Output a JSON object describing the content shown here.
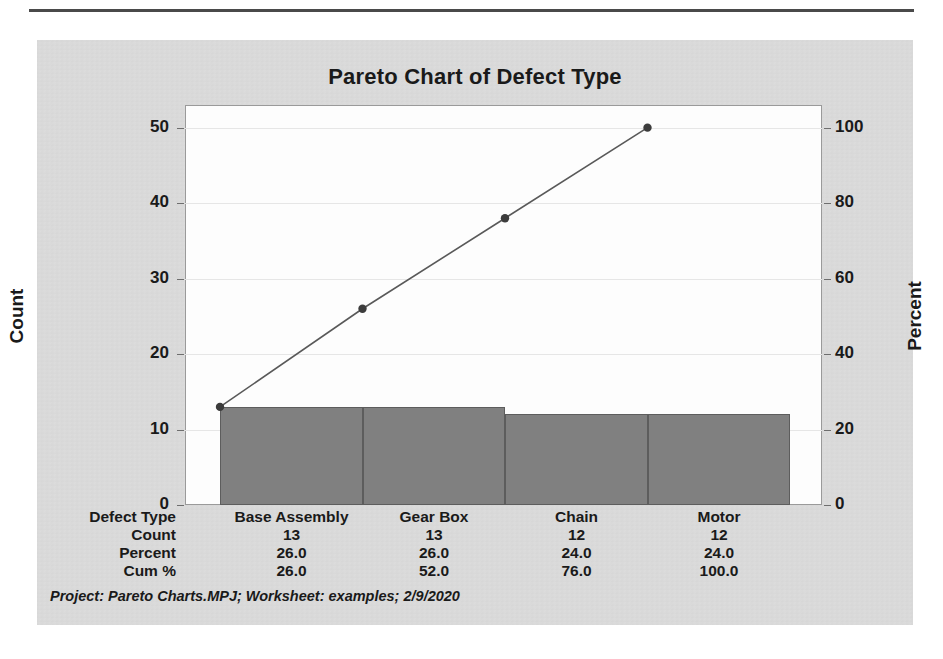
{
  "chart_data": {
    "type": "bar",
    "title": "Pareto Chart of Defect Type",
    "categories": [
      "Base Assembly",
      "Gear Box",
      "Chain",
      "Motor"
    ],
    "values": [
      13,
      13,
      12,
      12
    ],
    "percent": [
      26.0,
      26.0,
      24.0,
      24.0
    ],
    "cum_percent": [
      26.0,
      52.0,
      76.0,
      100.0
    ],
    "xlabel": "Defect Type",
    "ylabel": "Count",
    "y2label": "Percent",
    "ylim": [
      0,
      53
    ],
    "y2lim": [
      0,
      106
    ],
    "yticks": [
      "0",
      "10",
      "20",
      "30",
      "40",
      "50"
    ],
    "ytick_values": [
      0,
      10,
      20,
      30,
      40,
      50
    ],
    "y2ticks": [
      "0",
      "20",
      "40",
      "60",
      "80",
      "100"
    ],
    "y2tick_values": [
      0,
      20,
      40,
      60,
      80,
      100
    ],
    "grid": true,
    "legend": "none",
    "bar_color": "#808080",
    "line_color": "#595959",
    "marker_color": "#3c3c3c",
    "series": [
      {
        "name": "Count",
        "type": "bar",
        "values": [
          13,
          13,
          12,
          12
        ]
      },
      {
        "name": "Cum %",
        "type": "line",
        "values": [
          26.0,
          52.0,
          76.0,
          100.0
        ]
      }
    ]
  },
  "table": {
    "row_labels": [
      "Defect Type",
      "Count",
      "Percent",
      "Cum %"
    ],
    "rows": [
      [
        "Base Assembly",
        "Gear Box",
        "Chain",
        "Motor"
      ],
      [
        "13",
        "13",
        "12",
        "12"
      ],
      [
        "26.0",
        "26.0",
        "24.0",
        "24.0"
      ],
      [
        "26.0",
        "52.0",
        "76.0",
        "100.0"
      ]
    ]
  },
  "footer": {
    "note": "Project: Pareto Charts.MPJ; Worksheet: examples; 2/9/2020"
  },
  "axis": {
    "left_title": "Count",
    "right_title": "Percent"
  }
}
